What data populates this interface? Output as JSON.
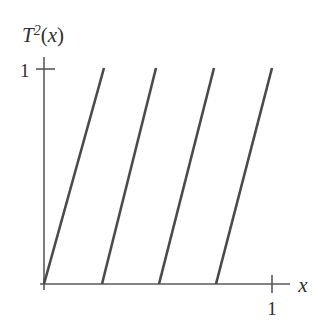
{
  "figure": {
    "background_color": "#ffffff",
    "line_color": "#4a4a4a",
    "axis_color": "#5a5a5a",
    "y_axis_label_base": "T",
    "y_axis_label_exponent": "2",
    "y_axis_label_open_paren": "(",
    "y_axis_label_variable": "x",
    "y_axis_label_close_paren": ")",
    "y_axis_label_full": "T²(x)",
    "x_axis_label": "x",
    "y_tick_label": "1",
    "x_tick_label": "1"
  },
  "chart_data": {
    "type": "line",
    "title": "",
    "xlabel": "x",
    "ylabel": "T²(x)",
    "xlim": [
      0,
      1.333
    ],
    "ylim": [
      0,
      1.24
    ],
    "grid": false,
    "legend": null,
    "xticks": [
      1
    ],
    "xticklabels": [
      "1"
    ],
    "yticks": [
      1
    ],
    "yticklabels": [
      "1"
    ],
    "series": [
      {
        "name": "branch-1",
        "x": [
          0.0,
          0.25
        ],
        "y": [
          0.0,
          1.0
        ]
      },
      {
        "name": "branch-2",
        "x": [
          0.2333,
          0.4533
        ],
        "y": [
          0.0,
          1.0
        ]
      },
      {
        "name": "branch-3",
        "x": [
          0.4667,
          0.7033
        ],
        "y": [
          0.0,
          1.0
        ]
      },
      {
        "name": "branch-4",
        "x": [
          0.7,
          0.9333
        ],
        "y": [
          0.0,
          1.0
        ]
      }
    ]
  },
  "geometry": {
    "origin_x": 44,
    "origin_y": 284,
    "y_axis_top": 57,
    "x_axis_right": 290,
    "y_one_level": 68,
    "x_one_tick": 272,
    "segments": [
      {
        "x1": 44,
        "y1": 284,
        "x2": 104,
        "y2": 68
      },
      {
        "x1": 102,
        "y1": 284,
        "x2": 156,
        "y2": 68
      },
      {
        "x1": 159,
        "y1": 284,
        "x2": 214,
        "y2": 68
      },
      {
        "x1": 216,
        "y1": 284,
        "x2": 272,
        "y2": 68
      }
    ]
  }
}
